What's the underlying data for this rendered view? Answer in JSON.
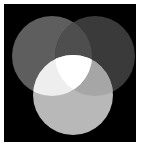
{
  "figure": {
    "canvas": {
      "background_color": "#000000",
      "page_background_color": "#ffffff",
      "left": 4,
      "top": 4,
      "width": 132,
      "height": 138
    }
  },
  "chart_data": {
    "type": "venn",
    "xlabel": "",
    "ylabel": "",
    "grid": false,
    "legend": "none",
    "background_color": "#000000",
    "sets": [
      {
        "name": "left-circle",
        "label": "",
        "color": "#5e5e5e",
        "cx": 48,
        "cy": 52,
        "r": 40
      },
      {
        "name": "right-circle",
        "label": "",
        "color": "#3a3a3a",
        "cx": 91,
        "cy": 52,
        "r": 40
      },
      {
        "name": "bottom-circle",
        "label": "",
        "color": "#b8b8b8",
        "cx": 69,
        "cy": 91,
        "r": 40
      }
    ],
    "regions": [
      {
        "name": "left-only",
        "color": "#5e5e5e"
      },
      {
        "name": "right-only",
        "color": "#3a3a3a"
      },
      {
        "name": "bottom-only",
        "color": "#b8b8b8"
      },
      {
        "name": "left-and-right",
        "color": "#4e4e4e"
      },
      {
        "name": "left-and-bottom",
        "color": "#eeeeee"
      },
      {
        "name": "right-and-bottom",
        "color": "#a6a6a6"
      },
      {
        "name": "all-three",
        "color": "#ffffff"
      }
    ]
  }
}
